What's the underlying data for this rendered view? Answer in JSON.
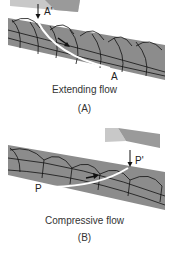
{
  "panels": [
    {
      "id": "A",
      "caption": "Extending flow",
      "letter": "(A)",
      "point_top": "A'",
      "point_bottom": "A"
    },
    {
      "id": "B",
      "caption": "Compressive flow",
      "letter": "(B)",
      "point_top": "P'",
      "point_bottom": "P"
    }
  ],
  "colors": {
    "band": "#8c8c8c",
    "grid_line": "#111111",
    "flow_path": "#ffffff",
    "slab_light": "#c8c8c8",
    "slab_dark": "#9a9a9a"
  }
}
